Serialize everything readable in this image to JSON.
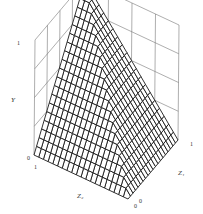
{
  "chart_data": {
    "type": "surface3d",
    "title": "",
    "axes": {
      "x": {
        "label": "Z1",
        "range": [
          0,
          1
        ],
        "ticks": [
          "0",
          "1"
        ]
      },
      "y": {
        "label": "Z2",
        "range": [
          0,
          1
        ],
        "ticks": [
          "0",
          "1"
        ]
      },
      "z": {
        "label": "Y",
        "range": [
          0,
          1
        ],
        "ticks": [
          "0",
          "1"
        ]
      }
    },
    "surface": {
      "description": "Surface Y = min(Z1, Z2) style copula upper bound over the unit square; rises from 0 at (0,0) to 1 at (1,1)",
      "grid_resolution": 20,
      "corner_values": {
        "z1_0_z2_0": 0,
        "z1_1_z2_0": 0,
        "z1_0_z2_1": 0,
        "z1_1_z2_1": 1
      }
    },
    "grid": true,
    "back_walls": {
      "grid_divisions": 4
    }
  },
  "labels": {
    "y_axis": "Y",
    "z1_axis": "Z₁",
    "z2_axis": "Z₂",
    "y_tick_top": "1",
    "y_tick_bottom": "0",
    "z2_tick_far": "1",
    "z1_tick_far": "1",
    "z1_tick_origin": "0",
    "z2_tick_origin": "0"
  },
  "colors": {
    "mesh": "#1a1a1a",
    "walls": "#777777",
    "background": "#ffffff"
  }
}
